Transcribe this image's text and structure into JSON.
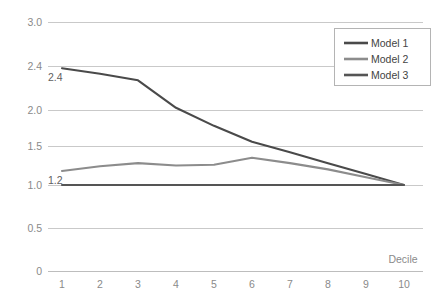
{
  "chart_data": {
    "type": "line",
    "title": "",
    "xlabel": "Decile",
    "ylabel": "",
    "x": [
      1,
      2,
      3,
      4,
      5,
      6,
      7,
      8,
      9,
      10
    ],
    "categories": [
      "1",
      "2",
      "3",
      "4",
      "5",
      "6",
      "7",
      "8",
      "9",
      "10"
    ],
    "series": [
      {
        "name": "Model 1",
        "color": "#4a4a4a",
        "values": [
          2.38,
          2.33,
          2.27,
          2.02,
          1.78,
          1.56,
          1.42,
          1.28,
          1.14,
          1.0
        ]
      },
      {
        "name": "Model 2",
        "color": "#8c8c8c",
        "values": [
          1.18,
          1.24,
          1.28,
          1.25,
          1.26,
          1.35,
          1.28,
          1.2,
          1.1,
          1.0
        ]
      },
      {
        "name": "Model 3",
        "color": "#555555",
        "values": [
          1.0,
          1.0,
          1.0,
          1.0,
          1.0,
          1.0,
          1.0,
          1.0,
          1.0,
          1.0
        ]
      }
    ],
    "ylim": [
      0,
      3.0
    ],
    "yticks": [
      0,
      0.5,
      1.0,
      1.5,
      2.0,
      2.4,
      3.0
    ],
    "ytick_labels": [
      "0",
      "0.5",
      "1.0",
      "1.5",
      "2.0",
      "2.4",
      "3.0"
    ],
    "grid": true,
    "legend_position": "upper-right",
    "annotations": [
      {
        "text": "2.4",
        "series": "Model 1",
        "x": 1,
        "y": 2.38
      },
      {
        "text": "1.2",
        "series": "Model 2",
        "x": 1,
        "y": 1.18
      }
    ]
  },
  "legend": {
    "entries": [
      {
        "label": "Model 1"
      },
      {
        "label": "Model 2"
      },
      {
        "label": "Model 3"
      }
    ]
  }
}
